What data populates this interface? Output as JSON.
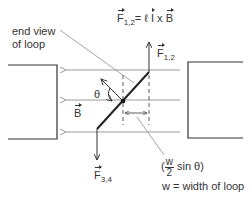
{
  "diagram": {
    "labels": {
      "end_view": "end view",
      "of_loop": "of loop",
      "force_eq_lhs": "F",
      "force_eq_lhs_sub": "1,2",
      "force_eq_rhs_l": "= ℓ ",
      "force_eq_i": "I",
      "force_eq_x": " x ",
      "force_eq_B": "B",
      "f12": "F",
      "f12_sub": "1,2",
      "f34": "F",
      "f34_sub": "3,4",
      "theta": "θ",
      "B": "B",
      "frac_num": "w",
      "frac_den": "2",
      "paren_open": "(",
      "sin_theta": "sin θ)",
      "w_def": "w = width of loop"
    },
    "colors": {
      "line": "#333333",
      "field": "#999999",
      "magnet": "#333333"
    }
  }
}
